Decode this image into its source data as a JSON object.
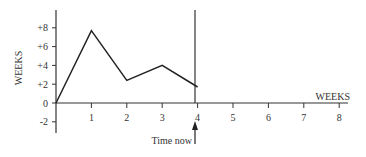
{
  "chart_data": {
    "type": "line",
    "title": "",
    "xlabel": "WEEKS",
    "ylabel": "WEEKS",
    "x": [
      0,
      1,
      2,
      3,
      4
    ],
    "values": [
      0,
      7.7,
      2.4,
      4.0,
      1.7
    ],
    "series": [
      {
        "name": "slippage",
        "x": [
          0,
          1,
          2,
          3,
          4
        ],
        "values": [
          0,
          7.7,
          2.4,
          4.0,
          1.7
        ]
      }
    ],
    "xlim": [
      0,
      8
    ],
    "ylim": [
      -3,
      10
    ],
    "x_ticks": [
      "1",
      "2",
      "3",
      "4",
      "5",
      "6",
      "7",
      "8"
    ],
    "y_ticks": [
      "+8",
      "+6",
      "+4",
      "+2",
      "0",
      "-2"
    ],
    "annotations": [
      {
        "text": "Time now",
        "x": 4,
        "type": "arrow-up"
      }
    ],
    "vertical_line_x": 4,
    "grid": false,
    "legend": "none"
  },
  "labels": {
    "y_axis": "WEEKS",
    "x_axis": "WEEKS",
    "time_now": "Time now",
    "y_ticks": [
      "+8",
      "+6",
      "+4",
      "+2",
      "0",
      "-2"
    ],
    "x_ticks": [
      "1",
      "2",
      "3",
      "4",
      "5",
      "6",
      "7",
      "8"
    ]
  }
}
